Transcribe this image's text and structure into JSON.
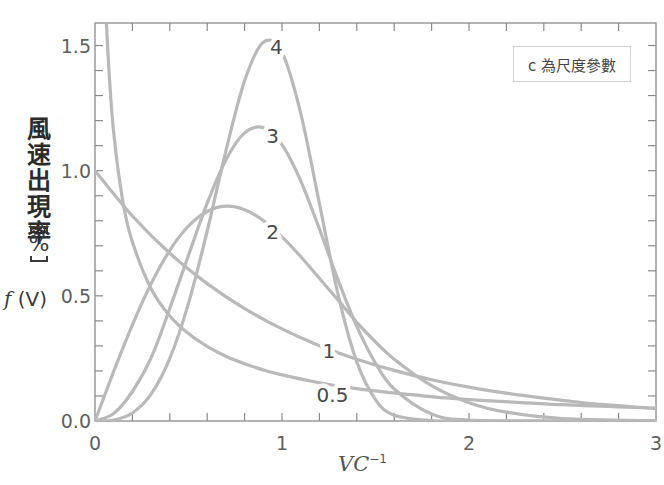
{
  "chart_data": {
    "type": "line",
    "title": "",
    "ylabel": "風速出現率",
    "ylabel_unit": "%",
    "ylabel_symbol_italic": "f",
    "ylabel_symbol_rest": " (V)",
    "xlabel": "VC",
    "xlabel_exponent": "−1",
    "legend_note": "c 為尺度參數",
    "legend_position": "top-right",
    "xlim": [
      0,
      3
    ],
    "ylim": [
      0,
      1.59
    ],
    "x_ticks": [
      0,
      1,
      2,
      3
    ],
    "x_tick_labels": [
      "0",
      "1",
      "2",
      "3"
    ],
    "x_minor_step": 0.2,
    "y_ticks": [
      0.0,
      0.5,
      1.0,
      1.5
    ],
    "y_tick_labels": [
      "0.0",
      "0.5",
      "1.0",
      "1.5"
    ],
    "y_minor_step": 0.1,
    "grid": false,
    "series_color": "#b9b9b9",
    "series": [
      {
        "name": "0.5",
        "shape_k": 0.5,
        "label_at": [
          1.27,
          0.105
        ],
        "x": [
          0.04,
          0.05,
          0.07,
          0.1,
          0.15,
          0.2,
          0.3,
          0.4,
          0.5,
          0.6,
          0.7,
          0.8,
          0.9,
          1.0,
          1.2,
          1.4,
          1.6,
          1.8,
          2.0,
          2.5,
          3.0
        ],
        "y": [
          2.05,
          1.788,
          1.46,
          1.153,
          0.873,
          0.715,
          0.528,
          0.42,
          0.349,
          0.298,
          0.259,
          0.229,
          0.204,
          0.184,
          0.153,
          0.129,
          0.112,
          0.097,
          0.086,
          0.065,
          0.051
        ]
      },
      {
        "name": "1",
        "shape_k": 1,
        "label_at": [
          1.25,
          0.278
        ],
        "x": [
          0,
          0.2,
          0.4,
          0.6,
          0.8,
          1.0,
          1.2,
          1.4,
          1.6,
          1.8,
          2.0,
          2.2,
          2.4,
          2.6,
          2.8,
          3.0
        ],
        "y": [
          1.0,
          0.819,
          0.67,
          0.549,
          0.449,
          0.368,
          0.301,
          0.247,
          0.202,
          0.165,
          0.135,
          0.111,
          0.091,
          0.074,
          0.061,
          0.05
        ]
      },
      {
        "name": "2",
        "shape_k": 2,
        "label_at": [
          0.95,
          0.755
        ],
        "x": [
          0,
          0.1,
          0.2,
          0.3,
          0.4,
          0.5,
          0.6,
          0.7,
          0.8,
          0.9,
          1.0,
          1.1,
          1.2,
          1.3,
          1.4,
          1.5,
          1.6,
          1.8,
          2.0,
          2.2,
          2.5,
          3.0
        ],
        "y": [
          0,
          0.198,
          0.384,
          0.548,
          0.682,
          0.779,
          0.837,
          0.858,
          0.844,
          0.801,
          0.736,
          0.657,
          0.57,
          0.483,
          0.394,
          0.316,
          0.247,
          0.141,
          0.073,
          0.035,
          0.01,
          0.001
        ]
      },
      {
        "name": "3",
        "shape_k": 3,
        "label_at": [
          0.95,
          1.14
        ],
        "x": [
          0,
          0.1,
          0.2,
          0.3,
          0.4,
          0.5,
          0.6,
          0.7,
          0.8,
          0.9,
          1.0,
          1.1,
          1.2,
          1.3,
          1.4,
          1.5,
          1.6,
          1.8,
          2.0,
          2.5,
          3.0
        ],
        "y": [
          0,
          0.03,
          0.118,
          0.252,
          0.45,
          0.662,
          0.87,
          1.043,
          1.151,
          1.172,
          1.104,
          0.959,
          0.767,
          0.563,
          0.378,
          0.231,
          0.128,
          0.028,
          0.004,
          0.0,
          0.0
        ]
      },
      {
        "name": "4",
        "shape_k": 4,
        "label_at": [
          0.97,
          1.495
        ],
        "x": [
          0,
          0.1,
          0.2,
          0.3,
          0.4,
          0.5,
          0.6,
          0.7,
          0.8,
          0.9,
          1.0,
          1.1,
          1.2,
          1.3,
          1.4,
          1.5,
          1.6,
          1.8,
          2.0,
          3.0
        ],
        "y": [
          0,
          0.004,
          0.032,
          0.107,
          0.25,
          0.47,
          0.759,
          1.079,
          1.359,
          1.513,
          1.472,
          1.23,
          0.869,
          0.505,
          0.236,
          0.085,
          0.023,
          0.001,
          0.0,
          0.0
        ]
      }
    ]
  }
}
